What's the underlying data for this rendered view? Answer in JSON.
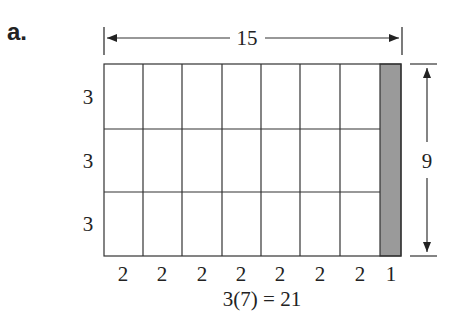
{
  "figure": {
    "part_label": "a.",
    "width_label": "15",
    "height_label": "9",
    "row_labels": [
      "3",
      "3",
      "3"
    ],
    "column_labels": [
      "2",
      "2",
      "2",
      "2",
      "2",
      "2",
      "2",
      "1"
    ],
    "equation": "3(7) = 21",
    "shaded_color": "#9a9a9a",
    "line_color": "#333333"
  }
}
